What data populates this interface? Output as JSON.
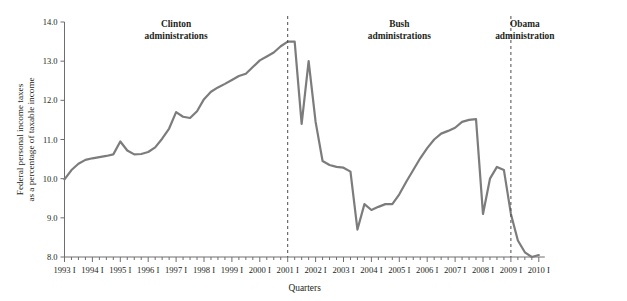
{
  "chart_data": {
    "type": "line",
    "title": "",
    "xlabel": "Quarters",
    "ylabel": "Federal personal income taxes as a percentage of taxable income",
    "ylim": [
      8.0,
      14.0
    ],
    "ytick_labels": [
      "14.0",
      "13.0",
      "12.0",
      "11.0",
      "10.0",
      "9.0",
      "8.0"
    ],
    "ytick_values": [
      14.0,
      13.0,
      12.0,
      11.0,
      10.0,
      9.0,
      8.0
    ],
    "xtick_labels": [
      "1993 I",
      "1994 I",
      "1995 I",
      "1996 I",
      "1997 I",
      "1998 I",
      "1999 I",
      "2000 I",
      "2001 I",
      "2002 I",
      "2003 I",
      "2004 I",
      "2005 I",
      "2006 I",
      "2007 I",
      "2008 I",
      "2009 I",
      "2010 I"
    ],
    "minor_ticks_per_year": 4,
    "grid": false,
    "legend": "none",
    "line_color": "#7c7c7c",
    "series": [
      {
        "name": "Federal personal income taxes as a percentage of taxable income",
        "x": [
          "1993 I",
          "1993 II",
          "1993 III",
          "1993 IV",
          "1994 I",
          "1994 II",
          "1994 III",
          "1994 IV",
          "1995 I",
          "1995 II",
          "1995 III",
          "1995 IV",
          "1996 I",
          "1996 II",
          "1996 III",
          "1996 IV",
          "1997 I",
          "1997 II",
          "1997 III",
          "1997 IV",
          "1998 I",
          "1998 II",
          "1998 III",
          "1998 IV",
          "1999 I",
          "1999 II",
          "1999 III",
          "1999 IV",
          "2000 I",
          "2000 II",
          "2000 III",
          "2000 IV",
          "2001 I",
          "2001 II",
          "2001 III",
          "2001 IV",
          "2002 I",
          "2002 II",
          "2002 III",
          "2002 IV",
          "2003 I",
          "2003 II",
          "2003 III",
          "2003 IV",
          "2004 I",
          "2004 II",
          "2004 III",
          "2004 IV",
          "2005 I",
          "2005 II",
          "2005 III",
          "2005 IV",
          "2006 I",
          "2006 II",
          "2006 III",
          "2006 IV",
          "2007 I",
          "2007 II",
          "2007 III",
          "2007 IV",
          "2008 I",
          "2008 II",
          "2008 III",
          "2008 IV",
          "2009 I",
          "2009 II",
          "2009 III",
          "2009 IV",
          "2010 I"
        ],
        "values": [
          9.98,
          10.22,
          10.38,
          10.48,
          10.52,
          10.55,
          10.58,
          10.62,
          10.95,
          10.72,
          10.62,
          10.63,
          10.68,
          10.8,
          11.02,
          11.28,
          11.7,
          11.58,
          11.55,
          11.72,
          12.03,
          12.22,
          12.33,
          12.42,
          12.52,
          12.62,
          12.68,
          12.85,
          13.02,
          13.12,
          13.22,
          13.38,
          13.5,
          13.5,
          11.4,
          13.0,
          11.45,
          10.45,
          10.35,
          10.3,
          10.28,
          10.18,
          8.7,
          9.35,
          9.2,
          9.28,
          9.35,
          9.35,
          9.6,
          9.92,
          10.22,
          10.52,
          10.78,
          11.0,
          11.15,
          11.22,
          11.3,
          11.45,
          11.5,
          11.52,
          9.1,
          10.0,
          10.3,
          10.22,
          9.1,
          8.42,
          8.12,
          8.0,
          8.05
        ]
      }
    ],
    "annotations": [
      {
        "label_line1": "Clinton",
        "label_line2": "administrations",
        "divider_at": "2001 I"
      },
      {
        "label_line1": "Bush",
        "label_line2": "administrations",
        "divider_at": "2009 I"
      },
      {
        "label_line1": "Obama",
        "label_line2": "administration",
        "divider_at": null
      }
    ]
  }
}
